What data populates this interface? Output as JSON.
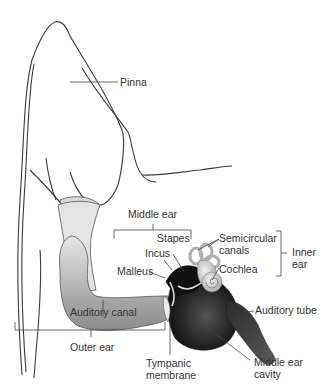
{
  "diagram": {
    "labels": {
      "pinna": "Pinna",
      "middle_ear": "Middle ear",
      "stapes": "Stapes",
      "incus": "Incus",
      "malleus": "Malleus",
      "semicircular_canals_line1": "Semicircular",
      "semicircular_canals_line2": "canals",
      "cochlea": "Cochlea",
      "inner_ear_line1": "Inner",
      "inner_ear_line2": "ear",
      "auditory_canal": "Auditory canal",
      "auditory_tube": "Auditory tube",
      "outer_ear": "Outer ear",
      "tympanic_membrane_line1": "Tympanic",
      "tympanic_membrane_line2": "membrane",
      "middle_ear_cavity_line1": "Middle ear",
      "middle_ear_cavity_line2": "cavity"
    },
    "colors": {
      "outline": "#3a3a3a",
      "label_text": "#333333",
      "leader_line": "#444444",
      "canal_fill": "#c8c8c8",
      "cavity_fill": "#1e1e1e",
      "inner_ear_fill": "#d6d6d6"
    }
  }
}
